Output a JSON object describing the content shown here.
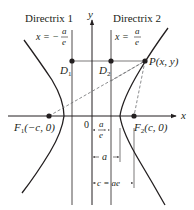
{
  "diagram": {
    "colors": {
      "ink": "#231f20",
      "dashed": "#6d6e71"
    },
    "axes": {
      "x_label": "x",
      "y_label": "y",
      "origin_label": "0"
    },
    "directrix1": {
      "title": "Directrix 1",
      "eq_lhs": "x = −",
      "eq_num": "a",
      "eq_den": "e"
    },
    "directrix2": {
      "title": "Directrix 2",
      "eq_lhs": "x =",
      "eq_num": "a",
      "eq_den": "e"
    },
    "points": {
      "D1": {
        "label": "D",
        "sub": "1"
      },
      "D2": {
        "label": "D",
        "sub": "2"
      },
      "P": {
        "label": "P(x, y)"
      },
      "F1": {
        "label": "F",
        "sub": "1",
        "coords": "(−c, 0)"
      },
      "F2": {
        "label": "F",
        "sub": "2",
        "coords": "(c, 0)"
      }
    },
    "dimensions": {
      "a_over_e": {
        "num": "a",
        "den": "e"
      },
      "a": {
        "label": "a"
      },
      "c": {
        "label": "c = ae"
      }
    }
  }
}
